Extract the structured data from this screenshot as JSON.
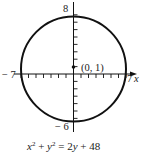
{
  "figure": {
    "type": "circle-graph",
    "equation": {
      "text": "x² + y² = 2y + 48",
      "parts": [
        "x",
        "2",
        " + ",
        "y",
        "2",
        " = 2",
        "y",
        " + 48"
      ]
    },
    "circle": {
      "center": [
        0,
        1
      ],
      "radius": 7,
      "center_label": "(0, 1)"
    },
    "axes": {
      "x_axis_label": "x",
      "x_min_label": "− 7",
      "x_max_label": "7",
      "y_max_label": "8",
      "y_min_label": "− 6",
      "x_ticks": [
        -7,
        -6,
        -5,
        -4,
        -3,
        -2,
        -1,
        1,
        2,
        3,
        4,
        5,
        6,
        7
      ],
      "y_ticks": [
        -6,
        -5,
        -4,
        -3,
        -2,
        -1,
        1,
        2,
        3,
        4,
        5,
        6,
        7,
        8
      ]
    },
    "colors": {
      "stroke": "#111111",
      "background": "#ffffff"
    }
  }
}
